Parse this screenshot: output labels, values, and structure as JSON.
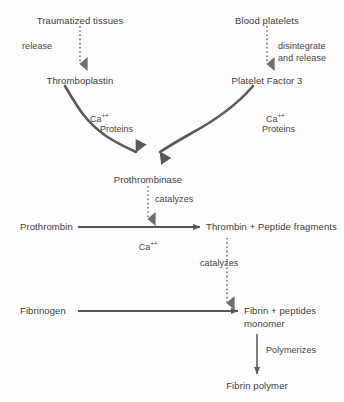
{
  "diagram": {
    "colors": {
      "background": "#fdfdfd",
      "text": "#3c3c3c",
      "arrow_solid": "#555555",
      "arrow_thick": "#5a5a5a",
      "arrow_dotted": "#6a6a6a"
    },
    "nodes": {
      "traumatized_tissues": "Traumatized tissues",
      "blood_platelets": "Blood platelets",
      "thromboplastin": "Thromboplastin",
      "platelet_factor_3": "Platelet Factor 3",
      "prothrombinase": "Prothrombinase",
      "prothrombin": "Prothrombin",
      "thrombin_products": "Thrombin + Peptide fragments",
      "fibrinogen": "Fibrinogen",
      "fibrin_products_line1": "Fibrin + peptides",
      "fibrin_products_line2": "monomer",
      "fibrin_polymer": "Fibrin polymer"
    },
    "edge_labels": {
      "release": "release",
      "disintegrate_line1": "disintegrate",
      "disintegrate_line2": "and release",
      "catalyzes_prothrombin": "catalyzes",
      "catalyzes_fibrinogen": "catalyzes",
      "polymerizes": "Polymerizes"
    },
    "cofactors": {
      "calcium_ion_symbol": "Ca",
      "calcium_ion_charge": "++",
      "proteins_left": "Proteins",
      "proteins_right": "Proteins"
    }
  }
}
